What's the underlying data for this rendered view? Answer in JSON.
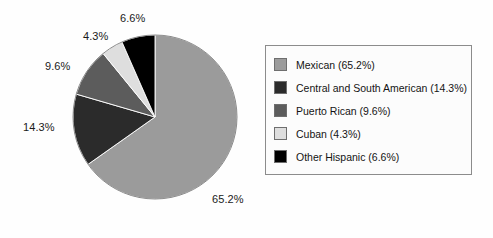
{
  "chart_data": {
    "type": "pie",
    "title": "",
    "categories": [
      "Mexican",
      "Central and South American",
      "Puerto Rican",
      "Cuban",
      "Other Hispanic"
    ],
    "values": [
      65.2,
      14.3,
      9.6,
      4.3,
      6.6
    ],
    "value_labels": [
      "65.2%",
      "14.3%",
      "9.6%",
      "4.3%",
      "6.6%"
    ],
    "colors": [
      "#9b9b9b",
      "#2b2b2b",
      "#5c5c5c",
      "#dedede",
      "#000000"
    ],
    "start_angle_deg": 0,
    "direction": "clockwise",
    "legend_position": "right",
    "legend_entries": [
      "Mexican (65.2%)",
      "Central and South American (14.3%)",
      "Puerto Rican (9.6%)",
      "Cuban (4.3%)",
      "Other Hispanic (6.6%)"
    ],
    "grid": false,
    "xlabel": "",
    "ylabel": ""
  },
  "slice_labels": [
    {
      "text": "65.2%",
      "x": 212,
      "y": 193
    },
    {
      "text": "14.3%",
      "x": 23,
      "y": 121
    },
    {
      "text": "9.6%",
      "x": 45,
      "y": 60
    },
    {
      "text": "4.3%",
      "x": 83,
      "y": 30
    },
    {
      "text": "6.6%",
      "x": 120,
      "y": 12
    }
  ]
}
